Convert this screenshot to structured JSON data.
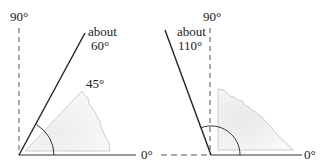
{
  "left_diagram": {
    "label_90": "90°",
    "label_0": "0°",
    "label_45": "45°",
    "label_about_line1": "about",
    "label_about_line2": "60°"
  },
  "right_diagram": {
    "label_90": "90°",
    "label_0": "0°",
    "label_about_line1": "about",
    "label_about_line2": "110°"
  },
  "colors": {
    "line": "#222222",
    "faint_line": "#b0b0b0",
    "shade": "#f0f0f0"
  }
}
